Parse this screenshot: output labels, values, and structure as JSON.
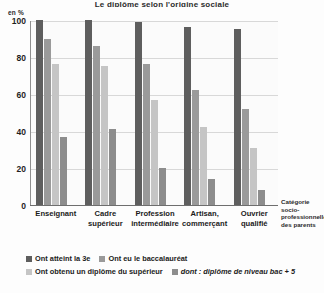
{
  "chart_data": {
    "type": "bar",
    "title": "Le diplôme selon l'origine sociale",
    "ylabel": "en %",
    "xlabel": "Catégorie socio-professionnelle des parents",
    "ylim": [
      0,
      100
    ],
    "yticks": [
      0,
      20,
      40,
      60,
      80,
      100
    ],
    "grid": true,
    "legend_position": "bottom",
    "categories": [
      "Enseignant",
      "Cadre supérieur",
      "Profession intermédiaire",
      "Artisan, commerçant",
      "Ouvrier qualifié"
    ],
    "series": [
      {
        "name": "Ont atteint la 3e",
        "color": "#5e5e5e",
        "values": [
          100,
          100,
          99,
          96,
          95
        ]
      },
      {
        "name": "Ont eu le baccalauréat",
        "color": "#9a9a9a",
        "values": [
          90,
          86,
          76,
          62,
          52
        ]
      },
      {
        "name": "Ont obtenu un diplôme du supérieur",
        "color": "#c5c5c5",
        "values": [
          76,
          75,
          57,
          42,
          31
        ]
      },
      {
        "name": "dont : diplôme de niveau bac + 5",
        "color": "#8d8d8d",
        "values": [
          37,
          41,
          20,
          14,
          8
        ]
      }
    ]
  },
  "axis": {
    "unit_label": "en %",
    "x_title_lines": [
      "Catégorie",
      "socio-",
      "professionnelle",
      "des parents"
    ]
  },
  "xlabels": [
    {
      "line1": "Enseignant",
      "line2": ""
    },
    {
      "line1": "Cadre",
      "line2": "supérieur"
    },
    {
      "line1": "Profession",
      "line2": "intermédiaire"
    },
    {
      "line1": "Artisan,",
      "line2": "commerçant"
    },
    {
      "line1": "Ouvrier",
      "line2": "qualifié"
    }
  ],
  "legend": {
    "rows": [
      [
        {
          "label": "Ont atteint la 3e",
          "color": "#5e5e5e",
          "italic": false
        },
        {
          "label": "Ont eu le baccalauréat",
          "color": "#9a9a9a",
          "italic": false
        }
      ],
      [
        {
          "label": "Ont obtenu un diplôme du supérieur",
          "color": "#c5c5c5",
          "italic": false
        },
        {
          "label": "dont : diplôme de niveau bac + 5",
          "color": "#8d8d8d",
          "italic": true
        }
      ]
    ]
  }
}
